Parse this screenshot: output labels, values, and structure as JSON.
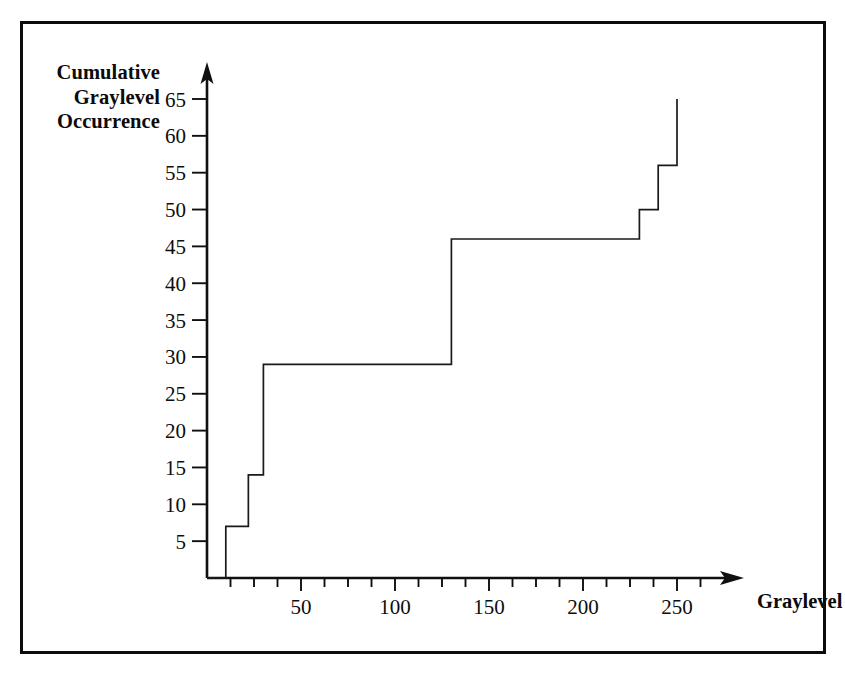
{
  "figure": {
    "border_color": "#0c0c0c",
    "background_color": "#ffffff",
    "line_color": "#1a1a1a"
  },
  "labels": {
    "y_axis_line1": "Cumulative",
    "y_axis_line2": "Graylevel",
    "y_axis_line3": "Occurrence",
    "x_axis_title": "Graylevel"
  },
  "chart_data": {
    "type": "line",
    "title": "",
    "subtitle": "",
    "xlabel": "Graylevel",
    "ylabel": "Cumulative Graylevel Occurrence",
    "xlim": [
      0,
      272
    ],
    "ylim": [
      0,
      68
    ],
    "grid": false,
    "legend": null,
    "drawstyle": "steps-post",
    "x_major_ticks": [
      50,
      100,
      150,
      200,
      250
    ],
    "x_minor_tick_interval": 12.5,
    "x_tick_labels": [
      "50",
      "100",
      "150",
      "200",
      "250"
    ],
    "y_ticks": [
      5,
      10,
      15,
      20,
      25,
      30,
      35,
      40,
      45,
      50,
      55,
      60,
      65
    ],
    "y_tick_labels": [
      "5",
      "10",
      "15",
      "20",
      "25",
      "30",
      "35",
      "40",
      "45",
      "50",
      "55",
      "60",
      "65"
    ],
    "axis_arrows": [
      "x-right",
      "y-up"
    ],
    "x": [
      0,
      10,
      22,
      30,
      130,
      230,
      240,
      250
    ],
    "values": [
      0,
      7,
      14,
      29,
      46,
      50,
      56,
      65
    ],
    "steps": [
      {
        "graylevel": 0,
        "cumulative": 0
      },
      {
        "graylevel": 10,
        "cumulative": 7
      },
      {
        "graylevel": 22,
        "cumulative": 14
      },
      {
        "graylevel": 30,
        "cumulative": 29
      },
      {
        "graylevel": 130,
        "cumulative": 46
      },
      {
        "graylevel": 230,
        "cumulative": 50
      },
      {
        "graylevel": 240,
        "cumulative": 56
      },
      {
        "graylevel": 250,
        "cumulative": 65
      }
    ],
    "max_cumulative": 65
  }
}
